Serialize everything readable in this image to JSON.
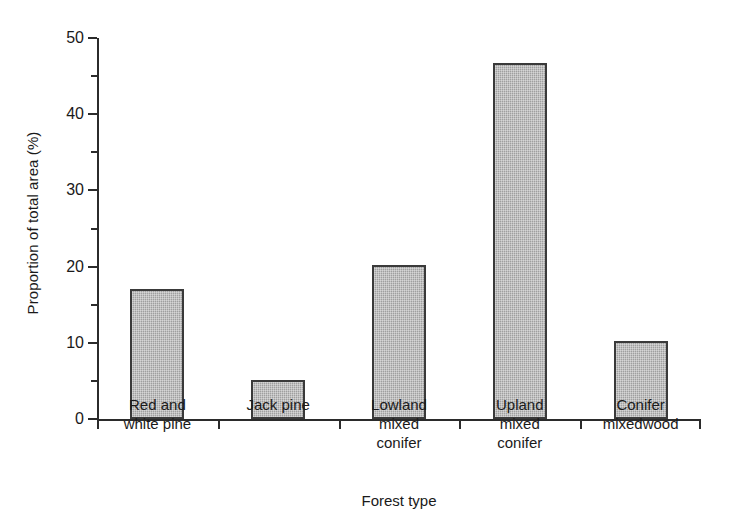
{
  "chart_data": {
    "type": "bar",
    "title": "",
    "subtitle": "",
    "xlabel": "Forest type",
    "ylabel": "Proportion of total area (%)",
    "categories": [
      "Red and white pine",
      "Jack pine",
      "Lowland mixed conifer",
      "Upland mixed conifer",
      "Conifer mixedwood"
    ],
    "category_lines": [
      [
        "Red and",
        "white pine"
      ],
      [
        "Jack pine"
      ],
      [
        "Lowland",
        "mixed",
        "conifer"
      ],
      [
        "Upland",
        "mixed",
        "conifer"
      ],
      [
        "Conifer",
        "mixedwood"
      ]
    ],
    "values": [
      17.1,
      5.1,
      20.2,
      46.7,
      10.2
    ],
    "ylim": [
      0,
      50
    ],
    "xlim": [
      0,
      5
    ],
    "y_major_ticks": [
      0,
      10,
      20,
      30,
      40,
      50
    ],
    "y_minor_ticks": [
      5,
      15,
      25,
      35,
      45
    ],
    "y_tick_labels": [
      "0",
      "10",
      "20",
      "30",
      "40",
      "50"
    ],
    "grid": false,
    "legend": null,
    "legend_position": "none",
    "bar_color": "#a9a9a9",
    "bar_edge_color": "#3a3a3a",
    "axis_color": "#2b2b2b",
    "background_color": "#ffffff"
  }
}
